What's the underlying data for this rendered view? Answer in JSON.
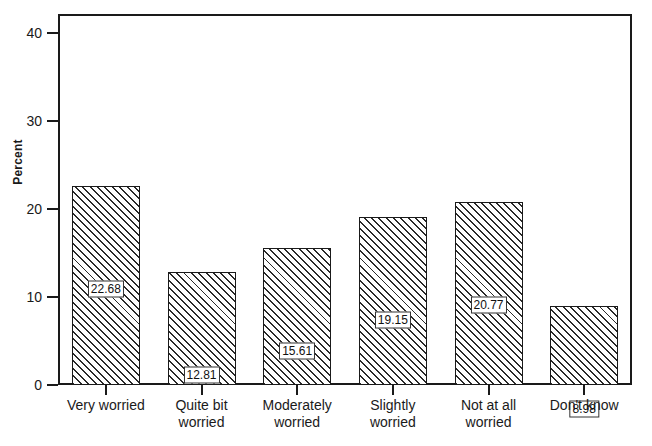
{
  "chart_data": {
    "type": "bar",
    "title": "",
    "xlabel": "",
    "ylabel": "Percent",
    "ylim": [
      0,
      42.2
    ],
    "yticks": [
      0,
      10,
      20,
      30,
      40
    ],
    "ytick_labels": [
      "0",
      "10",
      "20",
      "30",
      "40"
    ],
    "grid": false,
    "legend": null,
    "categories": [
      "Very worried",
      "Quite bit worried",
      "Moderately worried",
      "Slightly worried",
      "Not at all worried",
      "Don't know"
    ],
    "category_lines": [
      [
        "Very worried"
      ],
      [
        "Quite bit",
        "worried"
      ],
      [
        "Moderately",
        "worried"
      ],
      [
        "Slightly",
        "worried"
      ],
      [
        "Not at all",
        "worried"
      ],
      [
        "Don't know"
      ]
    ],
    "values": [
      22.68,
      12.81,
      15.61,
      19.15,
      20.77,
      8.98
    ],
    "value_labels": [
      "22.68",
      "12.81",
      "15.61",
      "19.15",
      "20.77",
      "8.98"
    ],
    "bar_style": {
      "fill": "#ffffff",
      "hatch": "diagonal-forward",
      "edge_color": "#1a1a1a"
    },
    "axis_color": "#1a1a1a",
    "background": "#ffffff"
  }
}
